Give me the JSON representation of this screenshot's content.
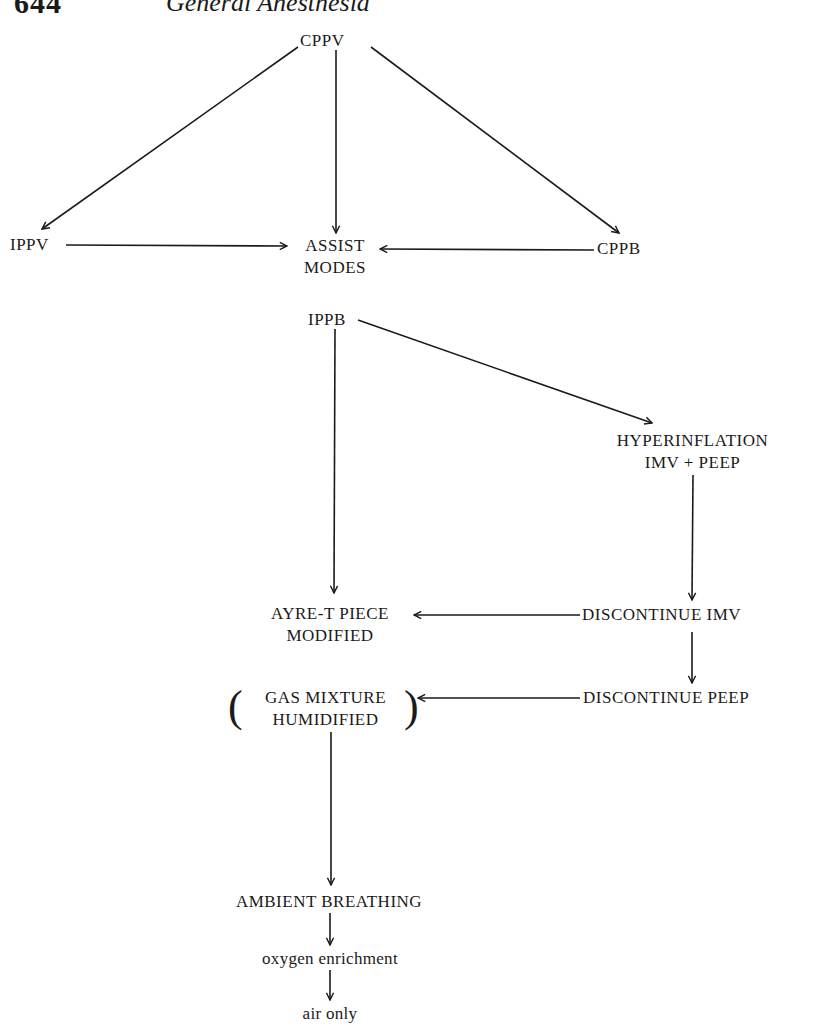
{
  "header": {
    "page_number": "644",
    "running_head": "General Anesthesia"
  },
  "diagram": {
    "nodes": {
      "cppv": "CPPV",
      "ippv": "IPPV",
      "assist_1": "ASSIST",
      "assist_2": "MODES",
      "cppb": "CPPB",
      "ippb": "IPPB",
      "hyper_1": "HYPERINFLATION",
      "hyper_2": "IMV + PEEP",
      "ayre_1": "AYRE-T PIECE",
      "ayre_2": "MODIFIED",
      "disc_imv": "DISCONTINUE IMV",
      "gas_1": "GAS MIXTURE",
      "gas_2": "HUMIDIFIED",
      "disc_peep": "DISCONTINUE PEEP",
      "ambient": "AMBIENT BREATHING",
      "oxygen": "oxygen enrichment",
      "air": "air only"
    },
    "edges": [
      {
        "from": "CPPV",
        "to": "IPPV"
      },
      {
        "from": "CPPV",
        "to": "ASSIST MODES"
      },
      {
        "from": "CPPV",
        "to": "CPPB"
      },
      {
        "from": "IPPV",
        "to": "ASSIST MODES"
      },
      {
        "from": "CPPB",
        "to": "ASSIST MODES"
      },
      {
        "from": "IPPB",
        "to": "AYRE-T PIECE MODIFIED"
      },
      {
        "from": "IPPB",
        "to": "HYPERINFLATION IMV + PEEP"
      },
      {
        "from": "HYPERINFLATION IMV + PEEP",
        "to": "DISCONTINUE IMV"
      },
      {
        "from": "DISCONTINUE IMV",
        "to": "AYRE-T PIECE MODIFIED"
      },
      {
        "from": "DISCONTINUE IMV",
        "to": "DISCONTINUE PEEP"
      },
      {
        "from": "DISCONTINUE PEEP",
        "to": "GAS MIXTURE HUMIDIFIED"
      },
      {
        "from": "GAS MIXTURE HUMIDIFIED",
        "to": "AMBIENT BREATHING"
      },
      {
        "from": "AMBIENT BREATHING",
        "to": "oxygen enrichment"
      },
      {
        "from": "oxygen enrichment",
        "to": "air only"
      }
    ],
    "line_color": "#1a1a1a",
    "text_color": "#1a1a1a"
  }
}
